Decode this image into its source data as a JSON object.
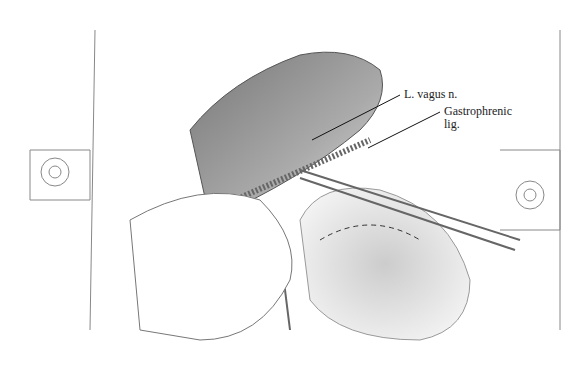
{
  "figure": {
    "type": "surgical illustration",
    "labels": [
      {
        "id": "vagus",
        "text": "L. vagus n."
      },
      {
        "id": "gastrophrenic_line1",
        "text": "Gastrophrenic"
      },
      {
        "id": "gastrophrenic_line2",
        "text": "lig."
      }
    ]
  }
}
